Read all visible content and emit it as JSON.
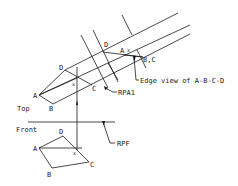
{
  "figure": {
    "type": "auxiliary-view descriptive geometry diagram",
    "views": {
      "top": {
        "label": "Top"
      },
      "front": {
        "label": "Front"
      },
      "auxiliary": {
        "edge_view_label": "Edge view of A-B-C-D"
      }
    },
    "reference_planes": {
      "rpa1": "RPA1",
      "rpf": "RPF"
    },
    "top_view_points": {
      "a": "A",
      "b": "B",
      "c": "C",
      "d": "D",
      "x": "x"
    },
    "aux_view_points": {
      "d": "D",
      "a": "A",
      "x": "x",
      "bc": "B,C"
    },
    "front_view_points": {
      "a": "A",
      "b": "B",
      "c": "C",
      "d": "D",
      "x": "x"
    },
    "colors": {
      "line": "#1a1a1a",
      "background": "#ffffff"
    }
  }
}
